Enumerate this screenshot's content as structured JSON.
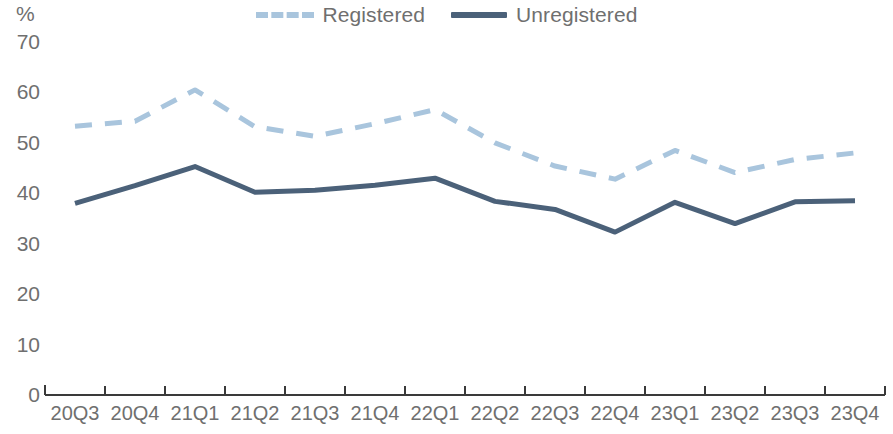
{
  "legend": {
    "items": [
      {
        "label": "Registered",
        "style": "dashed",
        "color": "#a9c5dd",
        "icon": "dashed-line-icon"
      },
      {
        "label": "Unregistered",
        "style": "solid",
        "color": "#4b6179",
        "icon": "solid-line-icon"
      }
    ]
  },
  "axis": {
    "y_unit": "%",
    "y_ticks": [
      "70",
      "60",
      "50",
      "40",
      "30",
      "20",
      "10",
      "0"
    ]
  },
  "chart_data": {
    "type": "line",
    "title": "",
    "subtitle": "",
    "xlabel": "",
    "ylabel": "%",
    "ylim": [
      0,
      70
    ],
    "ytick_values": [
      0,
      10,
      20,
      30,
      40,
      50,
      60,
      70
    ],
    "grid": false,
    "legend_position": "top-center",
    "categories": [
      "20Q3",
      "20Q4",
      "21Q1",
      "21Q2",
      "21Q3",
      "21Q4",
      "22Q1",
      "22Q2",
      "22Q3",
      "22Q4",
      "23Q1",
      "23Q2",
      "23Q3",
      "23Q4"
    ],
    "series": [
      {
        "name": "Registered",
        "color": "#a9c5dd",
        "style": "dashed",
        "values": [
          53.3,
          54.3,
          60.5,
          53.2,
          51.3,
          53.8,
          56.6,
          50.0,
          45.4,
          42.8,
          48.5,
          44.1,
          46.7,
          48.0
        ]
      },
      {
        "name": "Unregistered",
        "color": "#4b6179",
        "style": "solid",
        "values": [
          38.0,
          41.5,
          45.3,
          40.2,
          40.6,
          41.6,
          43.0,
          38.4,
          36.8,
          32.3,
          38.2,
          34.0,
          38.3,
          38.5
        ]
      }
    ]
  }
}
